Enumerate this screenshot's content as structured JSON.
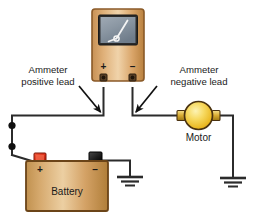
{
  "figure": {
    "kind": "electrical-circuit-diagram",
    "background_color": "#ffffff",
    "description_title": "Ammeter connected in series with a motor and battery"
  },
  "labels": {
    "ammeter_positive": {
      "line1": "Ammeter",
      "line2": "positive lead"
    },
    "ammeter_negative": {
      "line1": "Ammeter",
      "line2": "negative lead"
    },
    "motor": "Motor",
    "battery": "Battery"
  },
  "polarity": {
    "ammeter_plus": "+",
    "ammeter_minus": "–",
    "battery_plus": "+",
    "battery_minus": "–"
  },
  "components": {
    "ammeter": {
      "name": "ammeter",
      "body_color": "#d9a96c",
      "body_edge_color": "#8a5a28",
      "screen_color": "#8e9aa6",
      "screen_edge_color": "#2b2b2b",
      "needle_color": "#f2f2f2",
      "terminal_color": "#3a2a18"
    },
    "motor": {
      "name": "motor",
      "fill_color": "#f2c63c",
      "highlight_color": "#fdf0a8",
      "edge_color": "#4a3210",
      "terminal_color": "#c8a03a"
    },
    "battery": {
      "name": "battery",
      "body_color": "#d3a56a",
      "body_edge_color": "#6b4418",
      "positive_terminal_color": "#e0301e",
      "negative_terminal_color": "#1a1a1a"
    },
    "ground_symbol": {
      "name": "ground",
      "bar_count": 3,
      "color": "#2b2b2b"
    },
    "wire": {
      "color": "#2b2b2b",
      "width_px": 2
    },
    "junction_dots": {
      "count": 2,
      "color": "#111111"
    }
  },
  "annotations": {
    "arrow_color": "#111111",
    "arrow_count": 2
  }
}
